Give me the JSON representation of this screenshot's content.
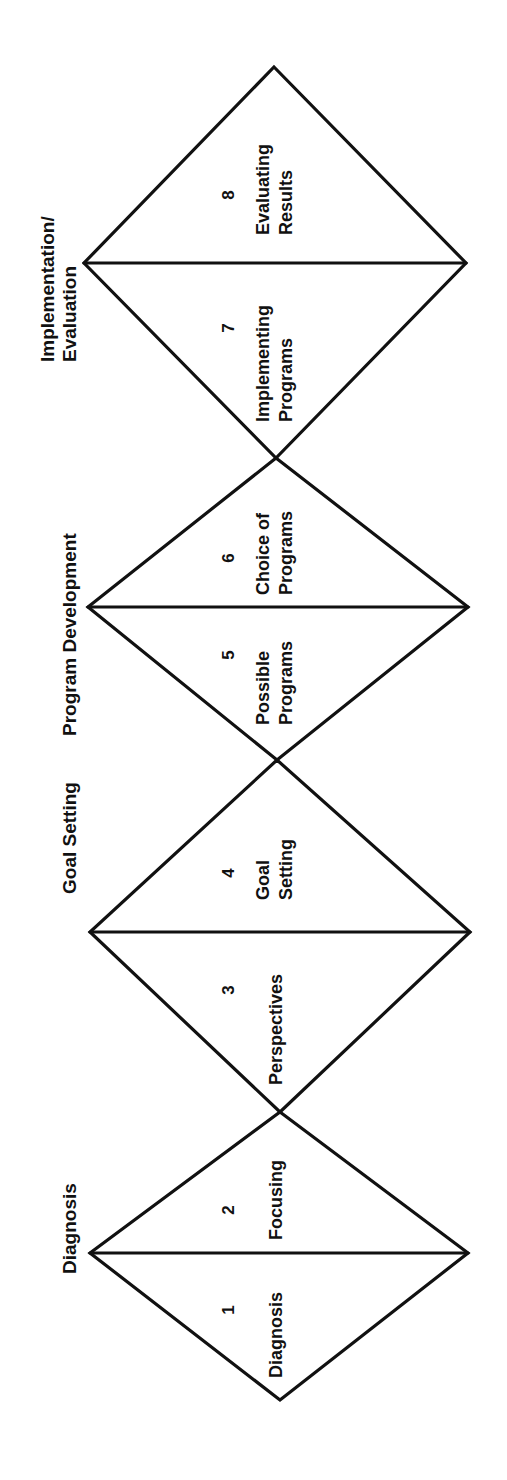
{
  "diagram": {
    "orientation": "rotated-90-ccw",
    "stroke_color": "#111111",
    "background": "#ffffff",
    "phases": [
      {
        "label_lines": [
          "Implementation/",
          "Evaluation"
        ]
      },
      {
        "label_lines": [
          "Program Development"
        ]
      },
      {
        "label_lines": [
          "Goal Setting"
        ]
      },
      {
        "label_lines": [
          "Diagnosis"
        ]
      }
    ],
    "steps": [
      {
        "number": "8",
        "name_lines": [
          "Evaluating",
          "Results"
        ]
      },
      {
        "number": "7",
        "name_lines": [
          "Implementing",
          "Programs"
        ]
      },
      {
        "number": "6",
        "name_lines": [
          "Choice of",
          "Programs"
        ]
      },
      {
        "number": "5",
        "name_lines": [
          "Possible",
          "Programs"
        ]
      },
      {
        "number": "4",
        "name_lines": [
          "Goal",
          "Setting"
        ]
      },
      {
        "number": "3",
        "name_lines": [
          "Perspectives"
        ]
      },
      {
        "number": "2",
        "name_lines": [
          "Focusing"
        ]
      },
      {
        "number": "1",
        "name_lines": [
          "Diagnosis"
        ]
      }
    ]
  }
}
